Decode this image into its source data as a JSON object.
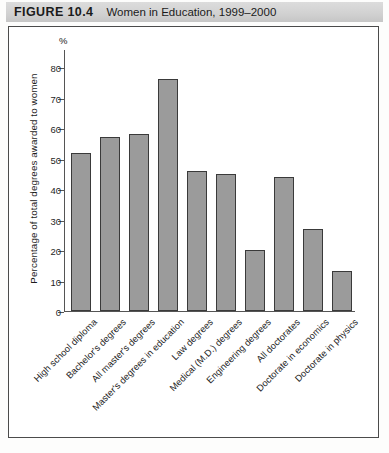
{
  "header": {
    "figure_number": "FIGURE 10.4",
    "title": "Women in Education, 1999–2000"
  },
  "chart_data": {
    "type": "bar",
    "title": "Women in Education, 1999–2000",
    "xlabel": "",
    "ylabel": "Percentage of total degrees awarded to women",
    "yunit": "%",
    "ylim": [
      0,
      80
    ],
    "yticks": [
      0,
      10,
      20,
      30,
      40,
      50,
      60,
      70,
      80
    ],
    "grid": false,
    "legend": "none",
    "bar_color": "#9b9b9b",
    "bar_edge_color": "#3a3a3a",
    "categories": [
      "High school diploma",
      "Bachelor's degrees",
      "All master's degrees",
      "Master's degrees in education",
      "Law degrees",
      "Medical (M.D.) degrees",
      "Engineering degrees",
      "All doctorates",
      "Doctorate in economics",
      "Doctorate in physics"
    ],
    "values": [
      52,
      57,
      58,
      76,
      46,
      45,
      20,
      44,
      27,
      13
    ]
  },
  "source_note": ""
}
